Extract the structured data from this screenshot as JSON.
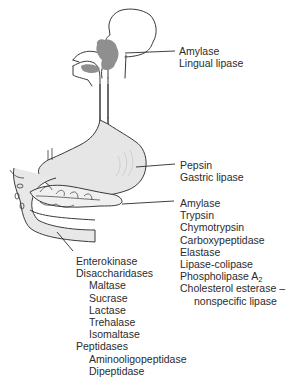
{
  "diagram": {
    "type": "anatomical-digestive-enzymes",
    "colors": {
      "line": "#3a3a3a",
      "shade": "#8f8f8f",
      "organ_fill": "#e6e6e6",
      "text": "#2b2b2b"
    }
  },
  "labels": {
    "mouth": {
      "items": [
        "Amylase",
        "Lingual lipase"
      ]
    },
    "stomach": {
      "items": [
        "Pepsin",
        "Gastric lipase"
      ]
    },
    "pancreas": {
      "items": [
        "Amylase",
        "Trypsin",
        "Chymotrypsin",
        "Carboxypeptidase",
        "Elastase",
        "Lipase-colipase"
      ],
      "phospholipase": {
        "text": "Phospholipase A",
        "subscript": "2"
      },
      "cholesterol": "Cholesterol esterase –",
      "cholesterol_cont": "nonspecific lipase"
    },
    "small_intestine": {
      "enterokinase": "Enterokinase",
      "disaccharidases": "Disaccharidases",
      "disaccharidase_items": [
        "Maltase",
        "Sucrase",
        "Lactase",
        "Trehalase",
        "Isomaltase"
      ],
      "peptidases": "Peptidases",
      "peptidase_items": [
        "Aminooligopeptidase",
        "Dipeptidase"
      ]
    }
  }
}
